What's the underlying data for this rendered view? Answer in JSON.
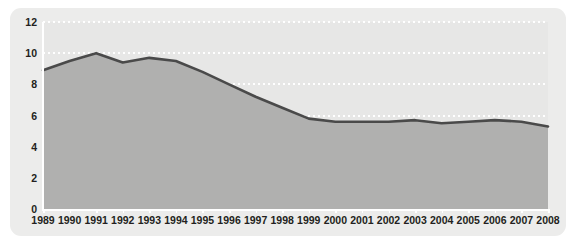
{
  "chart_data": {
    "type": "area",
    "title": "",
    "subtitle": "",
    "xlabel": "",
    "ylabel": "",
    "categories": [
      "1989",
      "1990",
      "1991",
      "1992",
      "1993",
      "1994",
      "1995",
      "1996",
      "1997",
      "1998",
      "1999",
      "2000",
      "2001",
      "2002",
      "2003",
      "2004",
      "2005",
      "2006",
      "2007",
      "2008"
    ],
    "values": [
      8.9,
      9.5,
      10.0,
      9.4,
      9.7,
      9.5,
      8.8,
      8.0,
      7.2,
      6.5,
      5.8,
      5.6,
      5.6,
      5.6,
      5.7,
      5.5,
      5.6,
      5.7,
      5.6,
      5.3
    ],
    "series": [
      {
        "name": "",
        "values": [
          8.9,
          9.5,
          10.0,
          9.4,
          9.7,
          9.5,
          8.8,
          8.0,
          7.2,
          6.5,
          5.8,
          5.6,
          5.6,
          5.6,
          5.7,
          5.5,
          5.6,
          5.7,
          5.6,
          5.3
        ]
      }
    ],
    "ylim": [
      0,
      12
    ],
    "y_ticks": [
      0,
      2,
      4,
      6,
      8,
      10,
      12
    ],
    "y_tick_labels": [
      "0",
      "2",
      "4",
      "6",
      "8",
      "10",
      "12"
    ],
    "xlim": [
      "1989",
      "2008"
    ],
    "grid": true,
    "grid_axis": "y",
    "grid_style": "dotted",
    "legend": false,
    "legend_position": "none",
    "annotations": []
  },
  "style": {
    "card_background": "#ececeb",
    "plot_background": "#e7e7e6",
    "area_fill": "#b0b0af",
    "line_color": "#4a4a4a",
    "grid_color": "#ffffff",
    "axis_color": "#ffffff",
    "text_color": "#231f20"
  }
}
